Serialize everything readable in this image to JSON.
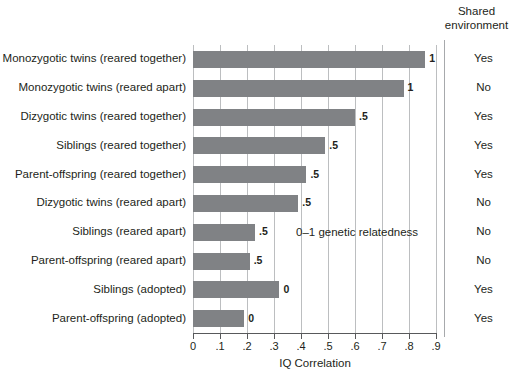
{
  "chart_data": {
    "type": "bar",
    "orientation": "horizontal",
    "title": "",
    "xlabel": "IQ Correlation",
    "ylabel": "",
    "xlim": [
      0,
      0.9
    ],
    "grid": true,
    "xticks": [
      "0",
      ".1",
      ".2",
      ".3",
      ".4",
      ".5",
      ".6",
      ".7",
      ".8",
      ".9"
    ],
    "xtick_values": [
      0,
      0.1,
      0.2,
      0.3,
      0.4,
      0.5,
      0.6,
      0.7,
      0.8,
      0.9
    ],
    "categories": [
      "Monozygotic twins (reared together)",
      "Monozygotic twins (reared apart)",
      "Dizygotic twins (reared together)",
      "Siblings (reared together)",
      "Parent-offspring (reared together)",
      "Dizygotic twins (reared apart)",
      "Siblings (reared apart)",
      "Parent-offspring (reared apart)",
      "Siblings (adopted)",
      "Parent-offspring (adopted)"
    ],
    "values": [
      0.86,
      0.78,
      0.6,
      0.49,
      0.42,
      0.39,
      0.23,
      0.21,
      0.32,
      0.19
    ],
    "bar_labels": [
      "1",
      "1",
      ".5",
      ".5",
      ".5",
      ".5",
      ".5",
      ".5",
      "0",
      "0"
    ],
    "annotation": "0–1 genetic relatedness",
    "bar_color": "#808285",
    "grid_color": "#bcbec0",
    "axis_color": "#58595b",
    "extra_column": {
      "header_line1": "Shared",
      "header_line2": "environment",
      "values": [
        "Yes",
        "No",
        "Yes",
        "Yes",
        "Yes",
        "No",
        "No",
        "No",
        "Yes",
        "Yes"
      ]
    }
  }
}
